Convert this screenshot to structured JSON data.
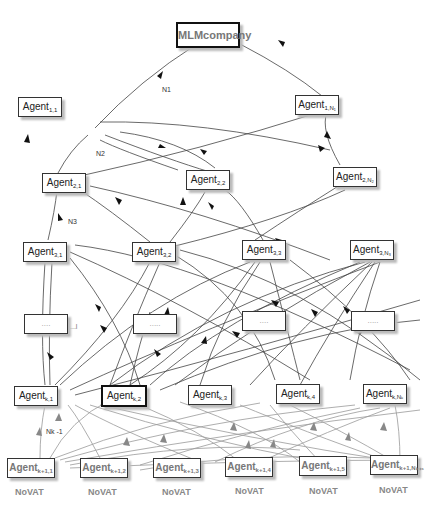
{
  "diagram": {
    "root": {
      "label": "MLMcompany"
    },
    "level_labels": {
      "n1": "N1",
      "n2": "N2",
      "n3": "N3",
      "nk1": "Nk -1",
      "ellipsis_side": "...l"
    },
    "nodes": [
      {
        "id": "r1c1",
        "base": "Agent",
        "sub": "1,1"
      },
      {
        "id": "r1cN",
        "base": "Agent",
        "sub": "1,N₁"
      },
      {
        "id": "r2c1",
        "base": "Agent",
        "sub": "2,1"
      },
      {
        "id": "r2c2",
        "base": "Agent",
        "sub": "2,2"
      },
      {
        "id": "r2cN",
        "base": "Agent",
        "sub": "2,N₂"
      },
      {
        "id": "r3c1",
        "base": "Agent",
        "sub": "3,1"
      },
      {
        "id": "r3c2",
        "base": "Agent",
        "sub": "3,2"
      },
      {
        "id": "r3c3",
        "base": "Agent",
        "sub": "3,3"
      },
      {
        "id": "r3cN",
        "base": "Agent",
        "sub": "3,N₃"
      },
      {
        "id": "d1",
        "base": "....",
        "sub": ""
      },
      {
        "id": "d2",
        "base": ".....",
        "sub": ""
      },
      {
        "id": "d3",
        "base": "....",
        "sub": ""
      },
      {
        "id": "d4",
        "base": ".....",
        "sub": ""
      },
      {
        "id": "rkc1",
        "base": "Agent",
        "sub": "k,1"
      },
      {
        "id": "rkc2",
        "base": "Agent",
        "sub": "k,2"
      },
      {
        "id": "rkc3",
        "base": "Agent",
        "sub": "k,3"
      },
      {
        "id": "rkc4",
        "base": "Agent",
        "sub": "k,4"
      },
      {
        "id": "rkcN",
        "base": "Agent",
        "sub": "k,Nₖ"
      },
      {
        "id": "rk1c1",
        "base": "Agent",
        "sub": "k+1,1"
      },
      {
        "id": "rk1c2",
        "base": "Agent",
        "sub": "k+1,2"
      },
      {
        "id": "rk1c3",
        "base": "Agent",
        "sub": "k+1,3"
      },
      {
        "id": "rk1c4",
        "base": "Agent",
        "sub": "k+1,4"
      },
      {
        "id": "rk1c5",
        "base": "Agent",
        "sub": "k+1,5"
      },
      {
        "id": "rk1cN",
        "base": "Agent",
        "sub": "k+1,Nₖ₊₁"
      }
    ],
    "novat_label": "NoVAT"
  }
}
